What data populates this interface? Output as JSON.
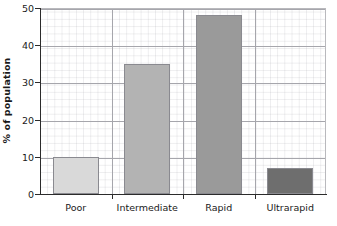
{
  "chart_data": {
    "type": "bar",
    "title": "",
    "xlabel": "",
    "ylabel": "% of population",
    "categories": [
      "Poor",
      "Intermediate",
      "Rapid",
      "Ultrarapid"
    ],
    "values": [
      10,
      35,
      48,
      7
    ],
    "series": [
      {
        "name": "% of population",
        "values": [
          10,
          35,
          48,
          7
        ]
      }
    ],
    "bar_colors": [
      "#d9d9d9",
      "#b3b3b3",
      "#9a9a9a",
      "#6e6e6e"
    ],
    "bar_border_color": "#8a8a90",
    "ylim": [
      0,
      50
    ],
    "yticks": [
      0,
      10,
      20,
      30,
      40,
      50
    ],
    "ytick_labels": [
      "0",
      "10",
      "20",
      "30",
      "40",
      "50"
    ],
    "grid": "graph-paper minor and major gridlines",
    "legend": "none",
    "axis_color": "#2b2b2b",
    "gridline_color": "#a6a6ac",
    "minor_gridline_color": "#c8c8d0",
    "background": "#ffffff"
  }
}
